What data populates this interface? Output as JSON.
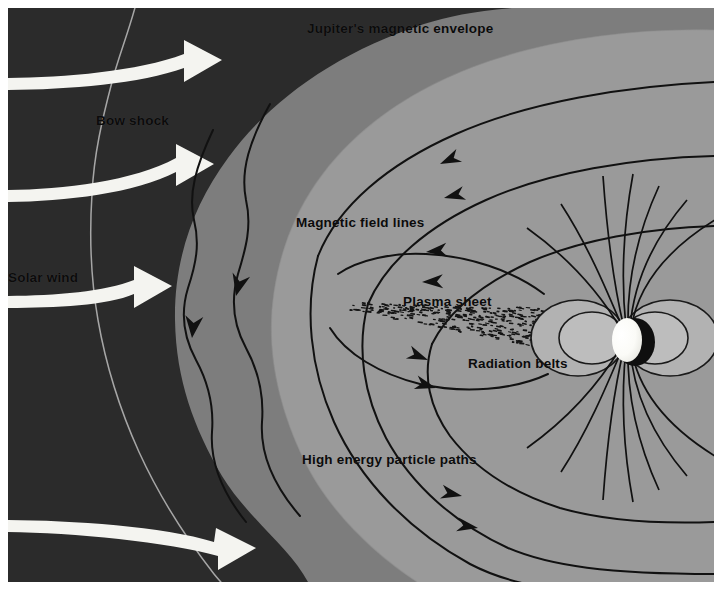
{
  "figure": {
    "title": "Jupiter's magnetic envelope",
    "width": 721,
    "height": 591
  },
  "labels": [
    {
      "id": "envelope",
      "text": "Jupiter's magnetic envelope",
      "x": 307,
      "y": 21,
      "color": "#0b0b0b"
    },
    {
      "id": "bow_shock",
      "text": "Bow shock",
      "x": 96,
      "y": 113,
      "color": "#0b0b0b"
    },
    {
      "id": "solar_wind",
      "text": "Solar wind",
      "x": 6,
      "y": 270,
      "color": "#0b0b0b"
    },
    {
      "id": "field_lines",
      "text": "Magnetic field lines",
      "x": 296,
      "y": 215,
      "color": "#0b0b0b"
    },
    {
      "id": "plasma_sheet",
      "text": "Plasma sheet",
      "x": 403,
      "y": 294,
      "color": "#0b0b0b"
    },
    {
      "id": "radiation_belts",
      "text": "Radiation belts",
      "x": 468,
      "y": 356,
      "color": "#0b0b0b"
    },
    {
      "id": "particle_paths",
      "text": "High energy particle paths",
      "x": 302,
      "y": 452,
      "color": "#0b0b0b"
    }
  ],
  "palette": {
    "outer_space": "#2b2b2b",
    "magnetosheath": "#7d7d7d",
    "magnetosphere": "#9a9a9a",
    "field_line": "#111111",
    "solar_wind_arrow": "#f4f4f0",
    "bow_shock_line": "#b9b9b9",
    "planet_lit": "#ffffff",
    "planet_shadow": "#101010",
    "belt_fill": "#b0b0b0",
    "plasma_dot": "#141414",
    "page_background": "#ffffff"
  },
  "regions": [
    {
      "name": "outer-space",
      "description": "dark region outside the bow shock, upstream solar wind"
    },
    {
      "name": "magnetosheath",
      "description": "medium gray shocked plasma between bow shock and magnetopause"
    },
    {
      "name": "magnetosphere",
      "description": "light gray cavity inside the magnetopause"
    }
  ],
  "solar_wind_arrows": {
    "count": 4,
    "direction": "left-to-right",
    "color": "#f4f4f0"
  },
  "field_line_arrow_counts": {
    "inbound_pointing_left": 4,
    "outbound_pointing_right": 4
  },
  "radiation_belts": {
    "rings_per_side": 2,
    "sides": 2
  },
  "planet": {
    "name": "Jupiter",
    "center_x": 623,
    "center_y": 338,
    "radius": 15
  }
}
